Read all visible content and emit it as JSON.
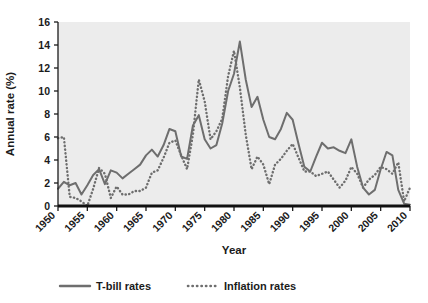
{
  "chart_data": {
    "type": "line",
    "title": "",
    "xlabel": "Year",
    "ylabel": "Annual rate (%)",
    "xlim": [
      1950,
      2010
    ],
    "ylim": [
      0,
      16
    ],
    "ytick_values": [
      0,
      2,
      4,
      6,
      8,
      10,
      12,
      14,
      16
    ],
    "ytick_labels": [
      "0",
      "2",
      "4",
      "6",
      "8",
      "10",
      "12",
      "14",
      "16"
    ],
    "xtick_values": [
      1950,
      1955,
      1960,
      1965,
      1970,
      1975,
      1980,
      1985,
      1990,
      1995,
      2000,
      2005,
      2010
    ],
    "xtick_labels": [
      "1950",
      "1955",
      "1960",
      "1965",
      "1970",
      "1975",
      "1980",
      "1985",
      "1990",
      "1995",
      "2000",
      "2005",
      "2010"
    ],
    "grid": false,
    "legend_position": "bottom",
    "plot_background": "#ececec",
    "line_color": "#6e6e6e",
    "axis_color": "#1b1b1b",
    "x": [
      1950,
      1951,
      1952,
      1953,
      1954,
      1955,
      1956,
      1957,
      1958,
      1959,
      1960,
      1961,
      1962,
      1963,
      1964,
      1965,
      1966,
      1967,
      1968,
      1969,
      1970,
      1971,
      1972,
      1973,
      1974,
      1975,
      1976,
      1977,
      1978,
      1979,
      1980,
      1981,
      1982,
      1983,
      1984,
      1985,
      1986,
      1987,
      1988,
      1989,
      1990,
      1991,
      1992,
      1993,
      1994,
      1995,
      1996,
      1997,
      1998,
      1999,
      2000,
      2001,
      2002,
      2003,
      2004,
      2005,
      2006,
      2007,
      2008,
      2009,
      2010
    ],
    "series": [
      {
        "name": "T-bill rates",
        "style": "solid",
        "color": "#6e6e6e",
        "values": [
          1.5,
          2.1,
          1.8,
          2.0,
          1.0,
          1.8,
          2.7,
          3.2,
          1.9,
          3.1,
          2.9,
          2.4,
          2.8,
          3.2,
          3.6,
          4.4,
          4.9,
          4.3,
          5.3,
          6.7,
          6.5,
          4.3,
          4.1,
          7.0,
          7.9,
          5.8,
          5.0,
          5.3,
          7.2,
          10.0,
          11.5,
          14.3,
          11.0,
          8.6,
          9.5,
          7.5,
          6.0,
          5.8,
          6.7,
          8.1,
          7.5,
          5.4,
          3.4,
          3.0,
          4.3,
          5.5,
          5.0,
          5.1,
          4.8,
          4.6,
          5.8,
          3.4,
          1.6,
          1.0,
          1.4,
          3.2,
          4.7,
          4.4,
          1.4,
          0.2,
          0.1
        ]
      },
      {
        "name": "Inflation rates",
        "style": "dotted",
        "color": "#6e6e6e",
        "values": [
          5.9,
          6.0,
          0.8,
          0.7,
          0.4,
          0.0,
          1.5,
          3.3,
          2.8,
          0.7,
          1.7,
          1.0,
          1.0,
          1.3,
          1.3,
          1.6,
          2.9,
          3.1,
          4.2,
          5.5,
          5.7,
          4.4,
          3.2,
          6.2,
          11.0,
          9.1,
          5.8,
          6.5,
          7.6,
          11.3,
          13.5,
          10.3,
          6.2,
          3.2,
          4.3,
          3.6,
          1.9,
          3.6,
          4.1,
          4.8,
          5.4,
          4.2,
          3.0,
          3.0,
          2.6,
          2.8,
          3.0,
          2.3,
          1.6,
          2.2,
          3.4,
          2.8,
          1.6,
          2.3,
          2.7,
          3.4,
          3.2,
          2.8,
          3.8,
          0.4,
          1.6
        ]
      }
    ]
  },
  "legend": {
    "items": [
      {
        "label": "T-bill rates",
        "style": "solid"
      },
      {
        "label": "Inflation rates",
        "style": "dotted"
      }
    ]
  },
  "axes": {
    "y_title": "Annual rate (%)",
    "x_title": "Year"
  }
}
